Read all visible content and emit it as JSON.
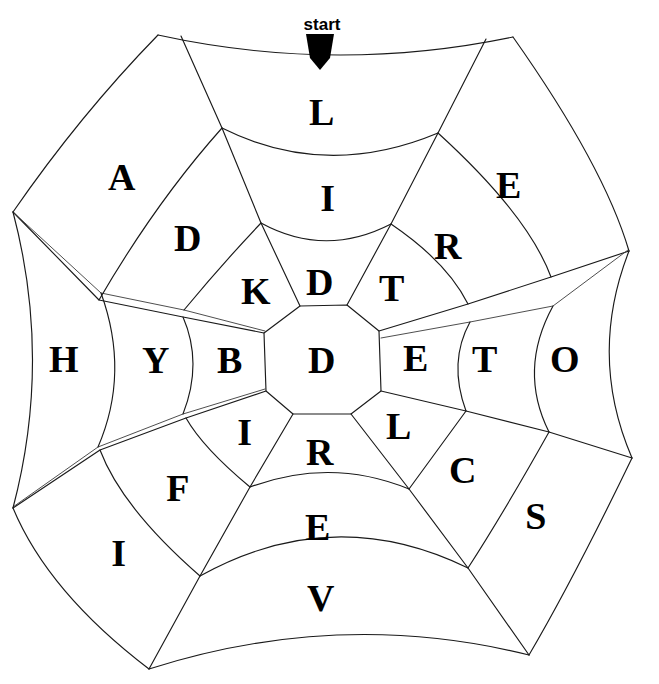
{
  "puzzle": {
    "type": "spiderweb-word-maze",
    "start_label": "start",
    "center_letter": "D",
    "rings": {
      "order_from_outside_in": [
        "outer",
        "middle",
        "inner",
        "center"
      ],
      "spoke_count": 8,
      "ring_count": 4
    },
    "spokes": [
      {
        "direction": "top",
        "angle_deg": 270,
        "letters": {
          "outer": "L",
          "middle": "I",
          "inner": "D"
        }
      },
      {
        "direction": "top-right",
        "angle_deg": 315,
        "letters": {
          "outer": "E",
          "middle": "R",
          "inner": "T"
        }
      },
      {
        "direction": "right",
        "angle_deg": 0,
        "letters": {
          "outer": "O",
          "middle": "T",
          "inner": "E"
        }
      },
      {
        "direction": "bottom-right",
        "angle_deg": 45,
        "letters": {
          "outer": "S",
          "middle": "C",
          "inner": "L"
        }
      },
      {
        "direction": "bottom",
        "angle_deg": 90,
        "letters": {
          "outer": "V",
          "middle": "E",
          "inner": "R"
        }
      },
      {
        "direction": "bottom-left",
        "angle_deg": 135,
        "letters": {
          "outer": "I",
          "middle": "F",
          "inner": "I"
        }
      },
      {
        "direction": "left",
        "angle_deg": 180,
        "letters": {
          "outer": "H",
          "middle": "Y",
          "inner": "B"
        }
      },
      {
        "direction": "top-left",
        "angle_deg": 225,
        "letters": {
          "outer": "A",
          "middle": "D",
          "inner": "K"
        }
      }
    ],
    "letter_cells": [
      {
        "id": "cell-center",
        "letter": "D",
        "x": 322,
        "y": 360
      },
      {
        "id": "cell-inner-top",
        "letter": "D",
        "x": 320,
        "y": 282
      },
      {
        "id": "cell-inner-tr",
        "letter": "T",
        "x": 392,
        "y": 288
      },
      {
        "id": "cell-inner-right",
        "letter": "E",
        "x": 416,
        "y": 358
      },
      {
        "id": "cell-inner-br",
        "letter": "L",
        "x": 399,
        "y": 426
      },
      {
        "id": "cell-inner-bottom",
        "letter": "R",
        "x": 320,
        "y": 452
      },
      {
        "id": "cell-inner-bl",
        "letter": "I",
        "x": 245,
        "y": 432
      },
      {
        "id": "cell-inner-left",
        "letter": "B",
        "x": 230,
        "y": 360
      },
      {
        "id": "cell-inner-tl",
        "letter": "K",
        "x": 256,
        "y": 291
      },
      {
        "id": "cell-middle-top",
        "letter": "I",
        "x": 328,
        "y": 198
      },
      {
        "id": "cell-middle-tr",
        "letter": "R",
        "x": 448,
        "y": 246
      },
      {
        "id": "cell-middle-right",
        "letter": "T",
        "x": 485,
        "y": 359
      },
      {
        "id": "cell-middle-br",
        "letter": "C",
        "x": 463,
        "y": 470
      },
      {
        "id": "cell-middle-bottom",
        "letter": "E",
        "x": 318,
        "y": 527
      },
      {
        "id": "cell-middle-bl",
        "letter": "F",
        "x": 178,
        "y": 488
      },
      {
        "id": "cell-middle-left",
        "letter": "Y",
        "x": 156,
        "y": 360
      },
      {
        "id": "cell-middle-tl",
        "letter": "D",
        "x": 188,
        "y": 238
      },
      {
        "id": "cell-outer-top",
        "letter": "L",
        "x": 322,
        "y": 112
      },
      {
        "id": "cell-outer-tr",
        "letter": "E",
        "x": 509,
        "y": 185
      },
      {
        "id": "cell-outer-right",
        "letter": "O",
        "x": 565,
        "y": 359
      },
      {
        "id": "cell-outer-br",
        "letter": "S",
        "x": 536,
        "y": 516
      },
      {
        "id": "cell-outer-bottom",
        "letter": "V",
        "x": 321,
        "y": 598
      },
      {
        "id": "cell-outer-bl",
        "letter": "I",
        "x": 119,
        "y": 553
      },
      {
        "id": "cell-outer-left",
        "letter": "H",
        "x": 64,
        "y": 359
      },
      {
        "id": "cell-outer-tl",
        "letter": "A",
        "x": 122,
        "y": 177
      }
    ],
    "start_marker": {
      "label": "start",
      "label_x": 322,
      "label_y": 24,
      "arrow_x": 320,
      "arrow_y": 44
    },
    "colors": {
      "background": "#ffffff",
      "line": "#1a1a1a",
      "letter": "#000000"
    }
  }
}
